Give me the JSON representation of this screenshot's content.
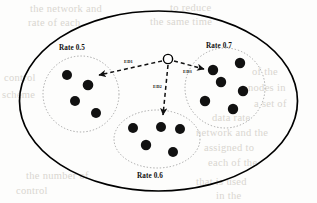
{
  "figure": {
    "caption_labels": {
      "left_cluster": "Rate 0.5",
      "right_cluster": "Rate 0.7",
      "bottom_cluster": "Rate 0.6"
    },
    "edge_labels": {
      "edge_1": "ED1",
      "edge_2": "ED2",
      "edge_3": "ED3"
    },
    "colors": {
      "node_fill": "#111111",
      "outline": "#000000",
      "cluster_outline": "#8a8a8a",
      "edge": "#1a1a1a",
      "background": "#fdfdfc",
      "bleed": "#d9d6d0"
    },
    "clusters": [
      {
        "name": "left-cluster",
        "label": "Rate 0.5",
        "rate": 0.5,
        "shape": "circle",
        "node_count": 4,
        "nodes": [
          {
            "cx": 67,
            "cy": 75,
            "r": 5.0
          },
          {
            "cx": 88,
            "cy": 85,
            "r": 5.3
          },
          {
            "cx": 75,
            "cy": 101,
            "r": 5.0
          },
          {
            "cx": 96,
            "cy": 113,
            "r": 5.0
          }
        ]
      },
      {
        "name": "right-cluster",
        "label": "Rate 0.7",
        "rate": 0.7,
        "shape": "circle",
        "node_count": 6,
        "nodes": [
          {
            "cx": 213,
            "cy": 70,
            "r": 5.2
          },
          {
            "cx": 240,
            "cy": 63,
            "r": 5.2
          },
          {
            "cx": 221,
            "cy": 82,
            "r": 5.2
          },
          {
            "cx": 243,
            "cy": 91,
            "r": 5.2
          },
          {
            "cx": 205,
            "cy": 101,
            "r": 5.2
          },
          {
            "cx": 233,
            "cy": 109,
            "r": 5.2
          }
        ]
      },
      {
        "name": "bottom-cluster",
        "label": "Rate 0.6",
        "rate": 0.6,
        "shape": "ellipse",
        "node_count": 5,
        "nodes": [
          {
            "cx": 133,
            "cy": 128,
            "r": 5.0
          },
          {
            "cx": 161,
            "cy": 127,
            "r": 5.0
          },
          {
            "cx": 180,
            "cy": 129,
            "r": 5.0
          },
          {
            "cx": 146,
            "cy": 145,
            "r": 5.2
          },
          {
            "cx": 173,
            "cy": 152,
            "r": 5.0
          }
        ]
      }
    ],
    "center_node": {
      "cx": 168,
      "cy": 59,
      "r": 4.6,
      "filled": false
    },
    "edges": [
      {
        "name": "edge-to-left",
        "label": "ED1",
        "from": [
          162,
          61
        ],
        "to": [
          97,
          75
        ],
        "style": "dashed",
        "arrow": true
      },
      {
        "name": "edge-to-bottom",
        "label": "ED2",
        "from": [
          168,
          64
        ],
        "to": [
          163,
          118
        ],
        "style": "dashed",
        "arrow": true
      },
      {
        "name": "edge-to-right",
        "label": "ED3",
        "from": [
          174,
          61
        ],
        "to": [
          207,
          70
        ],
        "style": "dashed",
        "arrow": true
      }
    ],
    "bleed_lines": [
      {
        "text": "the network and",
        "x": 30,
        "y": 10
      },
      {
        "text": "to reduce",
        "x": 170,
        "y": 9
      },
      {
        "text": "rate of each",
        "x": 28,
        "y": 24
      },
      {
        "text": "the same time",
        "x": 150,
        "y": 23
      },
      {
        "text": "control",
        "x": 8,
        "y": 78
      },
      {
        "text": "scheme",
        "x": 6,
        "y": 95
      },
      {
        "text": "of the",
        "x": 250,
        "y": 72
      },
      {
        "text": "nodes in",
        "x": 246,
        "y": 88
      },
      {
        "text": "a set of",
        "x": 252,
        "y": 104
      },
      {
        "text": "data rate",
        "x": 186,
        "y": 118
      },
      {
        "text": "network and the",
        "x": 172,
        "y": 133
      },
      {
        "text": "assigned to",
        "x": 178,
        "y": 148
      },
      {
        "text": "each of the",
        "x": 182,
        "y": 163
      },
      {
        "text": "the number of",
        "x": 30,
        "y": 175
      },
      {
        "text": "control",
        "x": 20,
        "y": 190
      },
      {
        "text": "that is used",
        "x": 186,
        "y": 182
      },
      {
        "text": "in the",
        "x": 206,
        "y": 195
      }
    ]
  }
}
